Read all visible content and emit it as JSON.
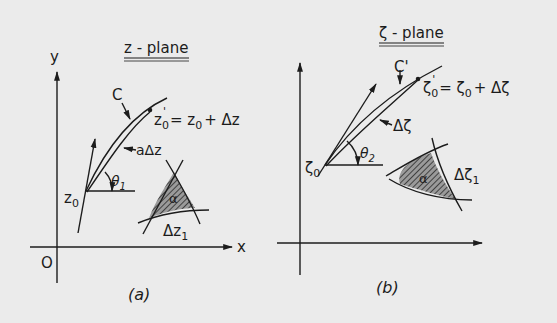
{
  "panel_a": {
    "title": "z - plane",
    "axis_x": "x",
    "axis_y": "y",
    "origin": "O",
    "curve_label": "C",
    "start_point": "z",
    "start_sub": "0",
    "end_point": "z",
    "end_sub": "0",
    "end_prime": "'",
    "end_eq": "= z",
    "end_eq_sub": "0",
    "end_eq_tail": "+ Δz",
    "chord_label": "aΔz",
    "angle_label": "θ",
    "angle_sub": "1",
    "region_angle": "α",
    "region_label": "Δz",
    "region_sub": "1",
    "caption": "(a)"
  },
  "panel_b": {
    "title": "ζ - plane",
    "curve_label": "C'",
    "start_point": "ζ",
    "start_sub": "0",
    "end_point": "ζ",
    "end_sub": "0",
    "end_prime": "'",
    "end_eq": "= ζ",
    "end_eq_sub": "0",
    "end_eq_tail": "+ Δζ",
    "chord_label": "Δζ",
    "angle_label": "θ",
    "angle_sub": "2",
    "region_angle": "α",
    "region_label": "Δζ",
    "region_sub": "1",
    "caption": "(b)"
  },
  "colors": {
    "background": "#ebebeb",
    "ink": "#1c1c1c"
  }
}
